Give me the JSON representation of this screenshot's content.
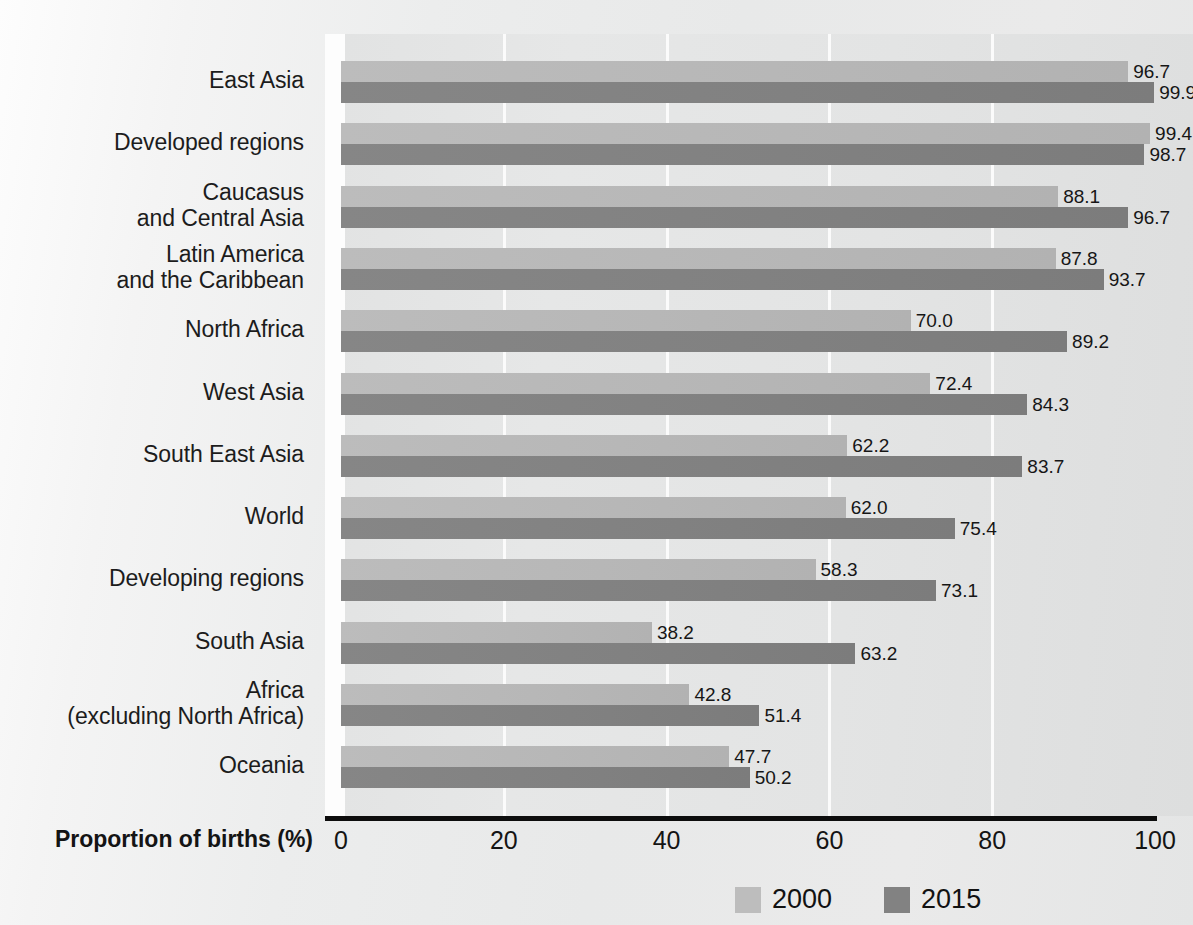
{
  "chart_data": {
    "type": "bar",
    "orientation": "horizontal",
    "title": "",
    "xlabel": "Proportion of births (%)",
    "ylabel": "",
    "xlim": [
      0,
      100
    ],
    "xticks": [
      "0",
      "20",
      "40",
      "60",
      "80",
      "100"
    ],
    "xtick_values": [
      0,
      20,
      40,
      60,
      80,
      100
    ],
    "grid": "vertical-white-gridlines",
    "legend_position": "bottom-center",
    "categories": [
      "East Asia",
      "Developed regions",
      "Caucasus\nand Central Asia",
      "Latin America\nand the Caribbean",
      "North Africa",
      "West Asia",
      "South East Asia",
      "World",
      "Developing regions",
      "South Asia",
      "Africa\n(excluding North Africa)",
      "Oceania"
    ],
    "series": [
      {
        "name": "2000",
        "color": "#bdbdbd",
        "values": [
          96.7,
          99.4,
          88.1,
          87.8,
          70.0,
          72.4,
          62.2,
          62.0,
          58.3,
          38.2,
          42.8,
          47.7
        ],
        "labels": [
          "96.7",
          "99.4",
          "88.1",
          "87.8",
          "70.0",
          "72.4",
          "62.2",
          "62.0",
          "58.3",
          "38.2",
          "42.8",
          "47.7"
        ]
      },
      {
        "name": "2015",
        "color": "#828282",
        "values": [
          99.9,
          98.7,
          96.7,
          93.7,
          89.2,
          84.3,
          83.7,
          75.4,
          73.1,
          63.2,
          51.4,
          50.2
        ],
        "labels": [
          "99.9",
          "98.7",
          "96.7",
          "93.7",
          "89.2",
          "84.3",
          "83.7",
          "75.4",
          "73.1",
          "63.2",
          "51.4",
          "50.2"
        ]
      }
    ]
  },
  "legend": {
    "items": [
      {
        "label": "2000",
        "color": "#bdbdbd"
      },
      {
        "label": "2015",
        "color": "#828282"
      }
    ]
  },
  "axis": {
    "title": "Proportion of births (%)",
    "ticks": [
      "0",
      "20",
      "40",
      "60",
      "80",
      "100"
    ]
  }
}
